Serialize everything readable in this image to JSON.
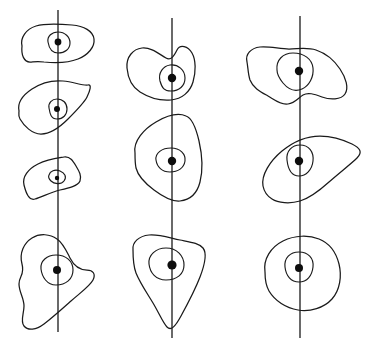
{
  "figure": {
    "title": "Hand-drawn nested contour figures along three vertical axes",
    "width": 384,
    "height": 351,
    "background_color": "#ffffff",
    "stroke_color": "#1a1a1a",
    "dot_color": "#0d0d0d",
    "column_count": 3,
    "blob_counts": [
      4,
      3,
      3
    ],
    "axes": [
      {
        "name": "left-axis",
        "x": 58,
        "y_top": 10,
        "y_bottom": 332
      },
      {
        "name": "middle-axis",
        "x": 172,
        "y_top": 18,
        "y_bottom": 338
      },
      {
        "name": "right-axis",
        "x": 300,
        "y_top": 16,
        "y_bottom": 338
      }
    ],
    "columns": [
      {
        "name": "left-column",
        "blobs": [
          {
            "name": "blob-left-1",
            "dot": {
              "cx": 58,
              "cy": 42,
              "r": 3.4
            },
            "outer": "M 22,46 C 20,38 26,29 36,26 C 46,23 60,24 72,25 C 84,26 93,31 94,39 C 95,47 88,55 78,59 C 68,63 54,63 44,62 C 37,61 33,62 30,62 C 24,62 21,55 22,46 Z",
            "inner": "M 48,42 C 47,36 52,32 58,32 C 65,32 70,37 70,43 C 70,49 65,53 58,53 C 52,53 49,48 48,42 Z"
          },
          {
            "name": "blob-left-2",
            "dot": {
              "cx": 57,
              "cy": 109,
              "r": 3.0
            },
            "outer": "M 19,111 C 17,102 23,95 32,89 C 41,83 52,80 63,81 C 74,82 83,86 88,85 C 92,84 90,91 87,97 C 84,103 76,111 68,119 C 60,127 50,134 41,134 C 32,134 24,126 20,119 C 18,116 19,113 19,111 Z",
            "inner": "M 49,108 C 48,103 52,99 57,99 C 63,99 67,103 67,109 C 67,115 63,119 57,119 C 51,119 50,114 49,108 Z"
          },
          {
            "name": "blob-left-3",
            "dot": {
              "cx": 57,
              "cy": 178,
              "r": 2.2
            },
            "outer": "M 24,185 C 22,177 28,169 38,164 C 48,159 58,158 64,157 C 70,156 73,161 76,166 C 79,171 82,176 80,181 C 78,186 69,188 60,190 C 51,192 42,197 35,199 C 29,201 26,193 24,185 Z",
            "inner": "M 49,175 C 50,171 55,169 60,171 C 65,173 67,177 64,181 C 61,185 54,184 51,181 C 49,179 48,177 49,175 Z"
          },
          {
            "name": "blob-left-4",
            "dot": {
              "cx": 57,
              "cy": 270,
              "r": 4.0
            },
            "outer": "M 22,264 C 19,253 24,243 32,238 C 40,233 50,234 57,239 C 63,243 66,250 70,258 C 74,266 80,270 87,270 C 93,270 96,274 93,280 C 90,286 80,293 71,301 C 62,309 52,318 44,324 C 36,330 28,331 24,326 C 20,321 24,314 24,306 C 24,298 19,292 19,284 C 19,276 25,275 22,264 Z",
            "inner": "M 41,269 C 40,261 47,255 56,255 C 66,255 73,261 73,270 C 73,279 66,285 56,285 C 47,285 42,277 41,269 Z"
          }
        ]
      },
      {
        "name": "middle-column",
        "blobs": [
          {
            "name": "blob-mid-1",
            "dot": {
              "cx": 172,
              "cy": 78,
              "r": 4.2
            },
            "outer": "M 127,68 C 126,57 133,49 142,48 C 151,47 159,54 166,58 C 171,61 174,56 177,50 C 180,44 188,46 192,53 C 196,60 196,72 193,82 C 190,92 182,99 171,100 C 160,101 148,97 140,92 C 132,87 128,79 127,68 Z",
            "inner": "M 160,81 C 158,73 163,66 170,65 C 178,64 185,70 185,78 C 185,86 179,91 171,91 C 164,91 162,88 160,81 Z"
          },
          {
            "name": "blob-mid-2",
            "dot": {
              "cx": 172,
              "cy": 161,
              "r": 4.2
            },
            "outer": "M 135,153 C 133,141 144,129 156,122 C 168,115 179,113 186,116 C 192,118 196,128 199,141 C 202,154 203,170 200,182 C 197,194 189,200 180,201 C 171,202 162,196 154,190 C 146,184 138,176 136,168 C 135,163 135,157 135,153 Z",
            "inner": "M 156,160 C 155,153 162,148 171,148 C 180,148 186,154 185,161 C 184,168 178,172 170,172 C 162,172 157,167 156,160 Z"
          },
          {
            "name": "blob-mid-3",
            "dot": {
              "cx": 172,
              "cy": 265,
              "r": 4.6
            },
            "outer": "M 133,250 C 132,242 139,236 149,235 C 159,234 170,238 180,240 C 190,242 199,243 203,248 C 207,253 205,264 200,277 C 195,290 187,305 181,316 C 175,327 171,331 167,327 C 163,323 159,313 153,303 C 147,293 140,283 136,273 C 133,265 133,256 133,250 Z",
            "inner": "M 149,264 C 148,255 156,248 166,248 C 177,248 184,256 184,265 C 184,274 177,280 166,280 C 156,280 150,273 149,264 Z"
          }
        ]
      },
      {
        "name": "right-column",
        "blobs": [
          {
            "name": "blob-right-1",
            "dot": {
              "cx": 299,
              "cy": 71,
              "r": 4.2
            },
            "outer": "M 247,62 C 245,54 251,48 260,47 C 269,46 280,49 289,49 C 298,49 307,47 316,50 C 325,53 334,60 340,69 C 346,78 349,88 345,94 C 341,100 330,100 322,97 C 314,94 308,92 303,95 C 298,98 295,103 288,104 C 281,105 275,100 268,96 C 261,92 253,88 250,80 C 248,74 248,67 247,62 Z",
            "inner": "M 277,70 C 276,60 283,53 293,53 C 304,53 312,59 313,68 C 314,77 309,86 302,89 C 295,92 288,89 283,83 C 279,78 277,74 277,70 Z"
          },
          {
            "name": "blob-right-2",
            "dot": {
              "cx": 299,
              "cy": 161,
              "r": 4.2
            },
            "outer": "M 263,186 C 261,175 270,161 282,151 C 294,141 308,136 320,136 C 332,136 344,140 352,144 C 360,148 363,152 357,158 C 351,164 339,173 329,182 C 319,191 310,198 300,201 C 290,204 278,203 272,199 C 267,196 264,191 263,186 Z",
            "inner": "M 287,160 C 286,151 292,145 300,145 C 309,145 314,152 313,161 C 312,170 306,176 299,176 C 291,176 288,169 287,160 Z"
          },
          {
            "name": "blob-right-3",
            "dot": {
              "cx": 299,
              "cy": 268,
              "r": 4.0
            },
            "outer": "M 265,272 C 263,259 271,247 283,241 C 295,235 309,235 319,239 C 329,243 336,252 339,264 C 342,276 340,290 332,299 C 324,308 310,312 298,310 C 286,308 275,301 269,291 C 265,284 265,277 265,272 Z",
            "inner": "M 285,267 C 284,258 290,252 299,252 C 308,252 314,258 313,267 C 312,276 307,282 299,282 C 291,282 286,276 285,267 Z"
          }
        ]
      }
    ]
  }
}
